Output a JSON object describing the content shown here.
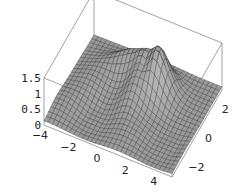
{
  "chart_data": {
    "type": "surface3d",
    "title": "",
    "xlabel": "",
    "ylabel": "",
    "zlabel": "",
    "x_range": [
      -4,
      5
    ],
    "y_range": [
      -3,
      3
    ],
    "z_range": [
      0,
      1.5
    ],
    "x_ticks": [
      "-4",
      "-2",
      "0",
      "2",
      "4"
    ],
    "y_ticks": [
      "-2",
      "0",
      "2"
    ],
    "z_ticks": [
      "0",
      "0.5",
      "1",
      "1.5"
    ],
    "grid": true,
    "box": true,
    "surface_color": "#9a9a9a",
    "mesh_color": "#3a3a3a"
  }
}
